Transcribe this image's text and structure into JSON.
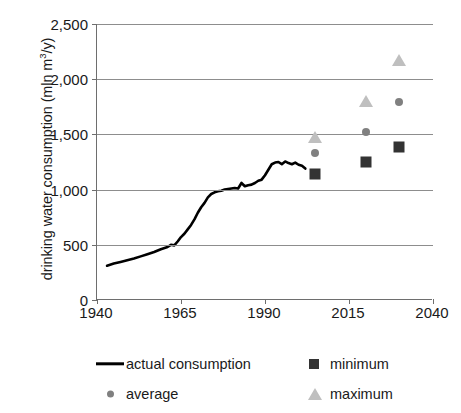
{
  "chart_data": {
    "type": "line",
    "title": "",
    "xlabel": "",
    "ylabel_prefix": "drinking water consumption (mln m",
    "ylabel_sup": "3",
    "ylabel_suffix": "/y)",
    "ylabel_plain": "drinking water consumption (mln m3/y)",
    "xlim": [
      1940,
      2040
    ],
    "ylim": [
      0,
      2500
    ],
    "xticks": [
      "1940",
      "1965",
      "1990",
      "2015",
      "2040"
    ],
    "xtick_values": [
      1940,
      1965,
      1990,
      2015,
      2040
    ],
    "yticks": [
      "0",
      "500",
      "1,000",
      "1,500",
      "2,000",
      "2,500"
    ],
    "ytick_values": [
      0,
      500,
      1000,
      1500,
      2000,
      2500
    ],
    "grid": "horizontal",
    "legend_position": "below",
    "colors": {
      "actual": "#000000",
      "average": "#808080",
      "minimum": "#333333",
      "maximum": "#bfbfbf",
      "grid": "#8d8d8d",
      "axis": "#6e6e6e"
    },
    "series": [
      {
        "name": "actual consumption",
        "marker": "line",
        "color": "#000000",
        "x": [
          1943,
          1945,
          1947,
          1949,
          1951,
          1953,
          1955,
          1957,
          1959,
          1961,
          1962,
          1963,
          1964,
          1965,
          1966,
          1967,
          1968,
          1969,
          1970,
          1971,
          1972,
          1973,
          1974,
          1975,
          1976,
          1977,
          1978,
          1979,
          1980,
          1981,
          1982,
          1983,
          1984,
          1985,
          1986,
          1987,
          1988,
          1989,
          1990,
          1991,
          1992,
          1993,
          1994,
          1995,
          1996,
          1997,
          1998,
          1999,
          2000,
          2001,
          2002
        ],
        "y": [
          310,
          330,
          345,
          360,
          375,
          395,
          415,
          435,
          460,
          480,
          500,
          495,
          530,
          570,
          600,
          640,
          680,
          730,
          790,
          840,
          880,
          930,
          960,
          975,
          985,
          990,
          1000,
          1005,
          1010,
          1015,
          1010,
          1060,
          1030,
          1040,
          1045,
          1060,
          1080,
          1090,
          1130,
          1180,
          1230,
          1245,
          1250,
          1230,
          1255,
          1240,
          1230,
          1245,
          1225,
          1215,
          1190
        ]
      },
      {
        "name": "average",
        "marker": "circle",
        "color": "#808080",
        "points": [
          {
            "x": 2005,
            "y": 1335
          },
          {
            "x": 2020,
            "y": 1520
          },
          {
            "x": 2030,
            "y": 1790
          }
        ]
      },
      {
        "name": "minimum",
        "marker": "square",
        "color": "#333333",
        "points": [
          {
            "x": 2005,
            "y": 1145
          },
          {
            "x": 2020,
            "y": 1250
          },
          {
            "x": 2030,
            "y": 1390
          }
        ]
      },
      {
        "name": "maximum",
        "marker": "triangle",
        "color": "#bfbfbf",
        "points": [
          {
            "x": 2005,
            "y": 1460
          },
          {
            "x": 2020,
            "y": 1780
          },
          {
            "x": 2030,
            "y": 2160
          }
        ]
      }
    ],
    "legend": [
      {
        "label": "actual consumption",
        "marker": "line",
        "color": "#000000"
      },
      {
        "label": "minimum",
        "marker": "square",
        "color": "#333333"
      },
      {
        "label": "average",
        "marker": "circle",
        "color": "#808080"
      },
      {
        "label": "maximum",
        "marker": "triangle",
        "color": "#bfbfbf"
      }
    ]
  }
}
